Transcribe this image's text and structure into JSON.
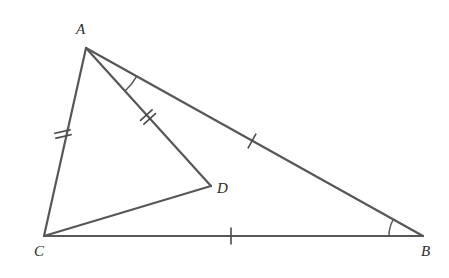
{
  "figure": {
    "kind": "geometry-diagram",
    "background_color": "#ffffff",
    "stroke_color": "#575757",
    "label_color": "#2b2b2b",
    "canvas": {
      "width": 449,
      "height": 278
    },
    "vertices": [
      {
        "id": "A",
        "label": "A",
        "x": 86,
        "y": 48,
        "label_x": 76,
        "label_y": 22
      },
      {
        "id": "B",
        "label": "B",
        "x": 423,
        "y": 236,
        "label_x": 421,
        "label_y": 244
      },
      {
        "id": "C",
        "label": "C",
        "x": 44,
        "y": 236,
        "label_x": 34,
        "label_y": 244
      },
      {
        "id": "D",
        "label": "D",
        "x": 211,
        "y": 186,
        "label_x": 217,
        "label_y": 181
      }
    ],
    "segments": [
      {
        "id": "AB",
        "from": "A",
        "to": "B",
        "x1": 86,
        "y1": 48,
        "x2": 423,
        "y2": 236
      },
      {
        "id": "AC",
        "from": "A",
        "to": "C",
        "x1": 86,
        "y1": 48,
        "x2": 44,
        "y2": 236
      },
      {
        "id": "CB",
        "from": "C",
        "to": "B",
        "x1": 44,
        "y1": 236,
        "x2": 423,
        "y2": 236
      },
      {
        "id": "AD",
        "from": "A",
        "to": "D",
        "x1": 86,
        "y1": 48,
        "x2": 211,
        "y2": 186
      },
      {
        "id": "CD",
        "from": "C",
        "to": "D",
        "x1": 44,
        "y1": 236,
        "x2": 211,
        "y2": 186
      }
    ],
    "tick_marks": [
      {
        "id": "tick-AC",
        "segment": "AC",
        "count": 2,
        "cx": 63,
        "cy": 134,
        "angle_deg": 77,
        "length": 17,
        "gap": 5
      },
      {
        "id": "tick-AD",
        "segment": "AD",
        "count": 2,
        "cx": 148,
        "cy": 117,
        "angle_deg": 48,
        "length": 17,
        "gap": 5
      },
      {
        "id": "tick-AB",
        "segment": "AB",
        "count": 1,
        "cx": 252,
        "cy": 141,
        "angle_deg": 29,
        "length": 17,
        "gap": 0
      },
      {
        "id": "tick-CB",
        "segment": "CB",
        "count": 1,
        "cx": 231,
        "cy": 236,
        "angle_deg": 0,
        "length": 17,
        "gap": 0
      }
    ],
    "angle_arcs": [
      {
        "id": "arc-A",
        "at": "A",
        "between": [
          "AD",
          "AB"
        ],
        "radius": 58,
        "start_deg": 47.8,
        "end_deg": 29.2
      },
      {
        "id": "arc-B",
        "at": "B",
        "between": [
          "BA",
          "BC"
        ],
        "radius": 34,
        "start_deg": 180.0,
        "end_deg": 209.2
      }
    ],
    "notes": {
      "congruence_single": "AB and CB carry one tick mark each",
      "congruence_double": "AC and AD carry two tick marks each",
      "marked_angles": "angle DAB at A and angle ABC at B are marked with arcs"
    }
  }
}
